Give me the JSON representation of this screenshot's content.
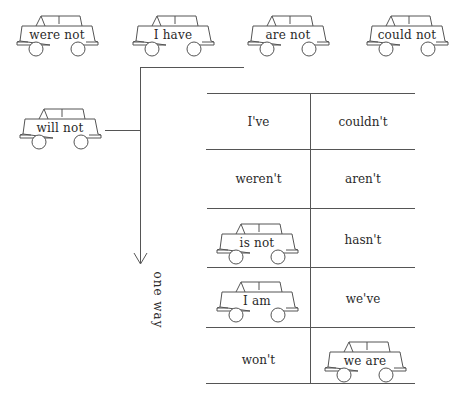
{
  "top_cars": [
    {
      "label": "were not"
    },
    {
      "label": "I have"
    },
    {
      "label": "are not"
    },
    {
      "label": "could not"
    }
  ],
  "side_car": {
    "label": "will not"
  },
  "arrow_label": "one way",
  "table": {
    "rows": [
      [
        {
          "type": "text",
          "value": "I've"
        },
        {
          "type": "text",
          "value": "couldn't"
        }
      ],
      [
        {
          "type": "text",
          "value": "weren't"
        },
        {
          "type": "text",
          "value": "aren't"
        }
      ],
      [
        {
          "type": "car",
          "value": "is not"
        },
        {
          "type": "text",
          "value": "hasn't"
        }
      ],
      [
        {
          "type": "car",
          "value": "I am"
        },
        {
          "type": "text",
          "value": "we've"
        }
      ],
      [
        {
          "type": "text",
          "value": "won't"
        },
        {
          "type": "car",
          "value": "we are"
        }
      ]
    ]
  },
  "colors": {
    "line": "#555555",
    "text": "#2a2a2a",
    "background": "#ffffff"
  }
}
